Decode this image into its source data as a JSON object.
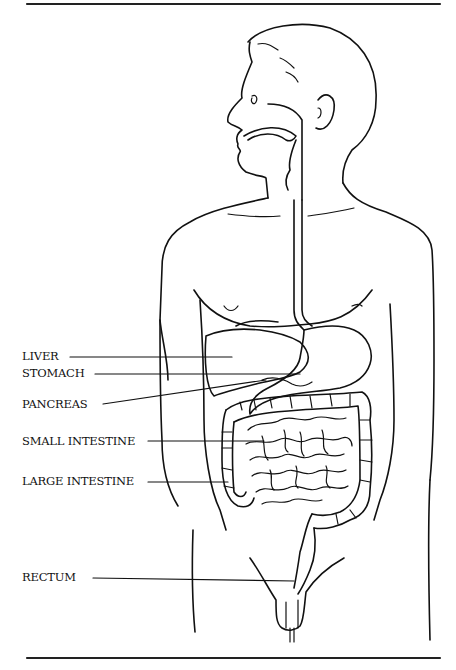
{
  "diagram": {
    "title": "",
    "labels": [
      {
        "id": "liver",
        "text": "LIVER"
      },
      {
        "id": "stomach",
        "text": "STOMACH"
      },
      {
        "id": "pancreas",
        "text": "PANCREAS"
      },
      {
        "id": "small-intestine",
        "text": "SMALL INTESTINE"
      },
      {
        "id": "large-intestine",
        "text": "LARGE INTESTINE"
      },
      {
        "id": "rectum",
        "text": "RECTUM"
      }
    ]
  }
}
